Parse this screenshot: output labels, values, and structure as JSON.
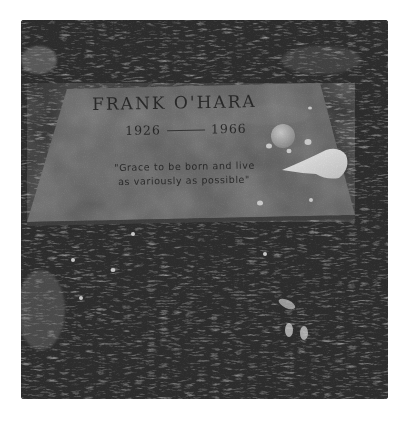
{
  "photo": {
    "subject": "Gravestone in grass",
    "style": "black-and-white",
    "colors": {
      "border": "#ffffff",
      "grass_dark": "#1e1e1e",
      "grass_light": "#8a8a8a",
      "stone": "#5e5e5e",
      "stone_light": "#747474",
      "shell": "#efefef",
      "pebble": "#d8d8d8"
    }
  },
  "gravestone": {
    "name": "FRANK O'HARA",
    "birth_year": "1926",
    "death_year": "1966",
    "epitaph_line1": "\"Grace to be born and live",
    "epitaph_line2": "as variously as possible\""
  },
  "objects_on_stone": [
    "round-stone",
    "conch-shell",
    "pebbles"
  ]
}
